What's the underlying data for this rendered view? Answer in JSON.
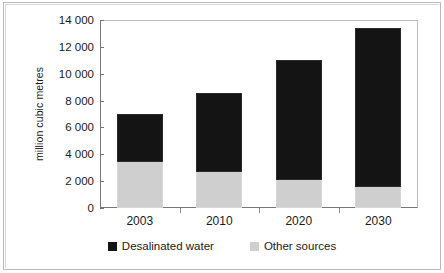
{
  "chart_data": {
    "type": "bar",
    "subtype": "stacked-bar",
    "title": "",
    "xlabel": "",
    "ylabel": "million cubic metres",
    "categories": [
      "2003",
      "2010",
      "2020",
      "2030"
    ],
    "series": [
      {
        "name": "Other sources",
        "color": "#cfcfcf",
        "values": [
          3400,
          2700,
          2100,
          1600
        ]
      },
      {
        "name": "Desalinated water",
        "color": "#141414",
        "values": [
          3600,
          5900,
          8900,
          11800
        ]
      }
    ],
    "totals": [
      7000,
      8600,
      11000,
      13400
    ],
    "ylim": [
      0,
      14000
    ],
    "ytick_values": [
      0,
      2000,
      4000,
      6000,
      8000,
      10000,
      12000,
      14000
    ],
    "ytick_labels": [
      "0",
      "2 000",
      "4 000",
      "6 000",
      "8 000",
      "10 000",
      "12 000",
      "14 000"
    ],
    "grid": false,
    "legend_position": "bottom",
    "legend": [
      {
        "label": "Desalinated water",
        "color": "#141414"
      },
      {
        "label": "Other sources",
        "color": "#cfcfcf"
      }
    ]
  }
}
